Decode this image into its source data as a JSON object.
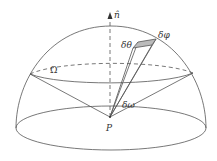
{
  "figure": {
    "labels": {
      "normal": "n̂",
      "omega_region": "Ω",
      "delta_theta": "δθ",
      "delta_phi": "δφ",
      "delta_omega": "δω",
      "point": "P"
    },
    "colors": {
      "stroke": "#555555",
      "patch_fill": "#bbbbbb",
      "background": "#ffffff"
    }
  }
}
